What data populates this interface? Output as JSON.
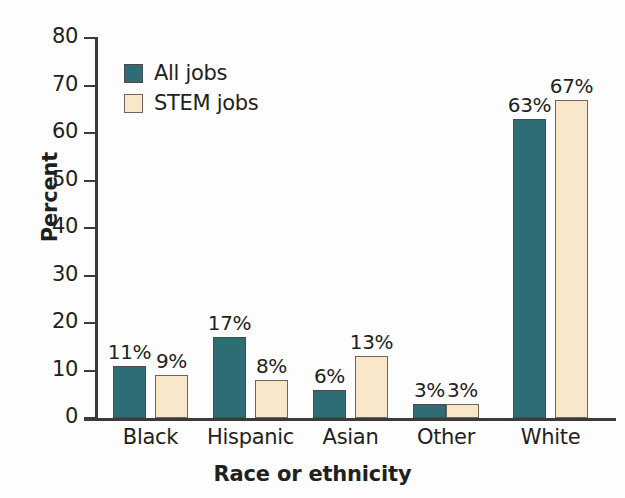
{
  "chart_data": {
    "type": "bar",
    "title": "",
    "xlabel": "Race or ethnicity",
    "ylabel": "Percent",
    "ylim": [
      0,
      80
    ],
    "ytick_step": 10,
    "yticks": [
      "0",
      "10",
      "20",
      "30",
      "40",
      "50",
      "60",
      "70",
      "80"
    ],
    "grid": false,
    "legend_position": "upper-left-inside",
    "categories": [
      "Black",
      "Hispanic",
      "Asian",
      "Other",
      "White"
    ],
    "series": [
      {
        "name": "All jobs",
        "color": "#2f6d74",
        "values": [
          11,
          17,
          6,
          3,
          63
        ],
        "labels": [
          "11%",
          "17%",
          "6%",
          "3%",
          "63%"
        ]
      },
      {
        "name": "STEM jobs",
        "color": "#f8e7c9",
        "values": [
          9,
          8,
          13,
          3,
          67
        ],
        "labels": [
          "9%",
          "8%",
          "13%",
          "3%",
          "67%"
        ]
      }
    ]
  },
  "legend": {
    "items": [
      {
        "label": "All jobs",
        "swatch": "all-jobs"
      },
      {
        "label": "STEM jobs",
        "swatch": "stem-jobs"
      }
    ]
  },
  "axes": {
    "y_title": "Percent",
    "x_title": "Race or ethnicity"
  }
}
